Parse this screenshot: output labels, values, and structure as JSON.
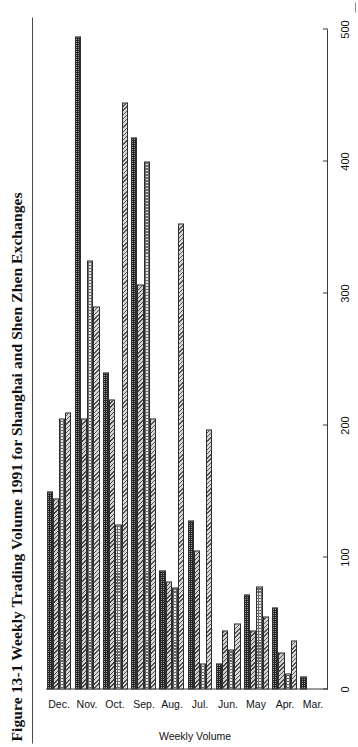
{
  "figure": {
    "title": "Figure 13-1  Weekly Trading Volume 1991 for Shanghai and Shen Zhen Exchanges"
  },
  "chart_data": {
    "type": "bar",
    "orientation": "horizontal",
    "title": "Figure 13-1  Weekly Trading Volume 1991 for Shanghai and Shen Zhen Exchanges",
    "xlabel": "Weekly Volume",
    "ylabel": "",
    "value_axis_label": "Weekly Volume",
    "grid": false,
    "legend": "none",
    "value_ticks": [
      0,
      100,
      200,
      300,
      400,
      500
    ],
    "value_range": [
      0,
      500
    ],
    "categories": [
      "Mar.",
      "Apr.",
      "May",
      "Jun.",
      "Jul.",
      "Aug.",
      "Sep.",
      "Oct.",
      "Nov.",
      "Dec."
    ],
    "bars_per_category": 4,
    "fill_patterns": [
      "hatch",
      "dot",
      "hatch2",
      "check"
    ],
    "values_by_month": {
      "Mar.": [
        0,
        0,
        0,
        10
      ],
      "Apr.": [
        37,
        12,
        28,
        62
      ],
      "May": [
        55,
        78,
        45,
        72
      ],
      "Jun.": [
        50,
        30,
        45,
        20
      ],
      "Jul.": [
        197,
        20,
        105,
        128
      ],
      "Aug.": [
        353,
        77,
        82,
        90
      ],
      "Sep.": [
        205,
        400,
        307,
        418
      ],
      "Oct.": [
        445,
        125,
        220,
        240
      ],
      "Nov.": [
        290,
        325,
        205,
        495
      ],
      "Dec.": [
        210,
        205,
        145,
        150
      ]
    },
    "flat_values": [
      0,
      0,
      0,
      10,
      37,
      12,
      28,
      62,
      55,
      78,
      45,
      72,
      50,
      30,
      45,
      20,
      197,
      20,
      105,
      128,
      353,
      77,
      82,
      90,
      205,
      400,
      307,
      418,
      445,
      125,
      220,
      240,
      290,
      325,
      205,
      495,
      210,
      205,
      145,
      150
    ]
  },
  "colors": {
    "axis": "#3b3b3b",
    "text": "#111111",
    "rule": "#4a4a4a"
  }
}
